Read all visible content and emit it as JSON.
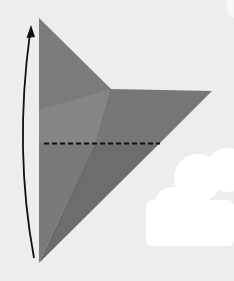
{
  "diagram": {
    "kind": "origami-fold-step",
    "background_color": "#ededed",
    "paper": {
      "outline": [
        [
          39,
          18
        ],
        [
          111,
          89
        ],
        [
          212,
          91
        ],
        [
          39,
          263
        ]
      ],
      "colors": {
        "upper_left_panel": "#7b7b7b",
        "inner_flap": "#8a8a8a",
        "right_flap": "#767676",
        "lower_panel": "#6f6f6f",
        "crease_line": "#5a5a5a"
      }
    },
    "fold_line": {
      "style": "dashed",
      "color": "#111111",
      "from": [
        44,
        143
      ],
      "to": [
        160,
        143
      ]
    },
    "arrow": {
      "direction": "up",
      "color": "#111111",
      "meaning": "fold bottom point up to top point"
    },
    "decorations": [
      {
        "type": "cloud",
        "color": "#ffffff"
      },
      {
        "type": "star-corner",
        "color": "#f7f7f7"
      }
    ]
  }
}
